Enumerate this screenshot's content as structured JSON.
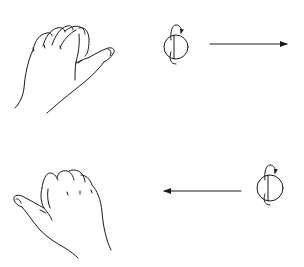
{
  "diagram": {
    "panels": [
      {
        "id": "top",
        "hand": "right-hand-thumb-pointing-right",
        "sphere": {
          "center": [
            176,
            47
          ],
          "radius": 12,
          "rotation_arrow": "curved-around-vertical-axis"
        },
        "arrow": {
          "direction": "right",
          "from": [
            210,
            44
          ],
          "to": [
            287,
            44
          ]
        }
      },
      {
        "id": "bottom",
        "hand": "left-hand-thumb-pointing-left",
        "sphere": {
          "center": [
            270,
            188
          ],
          "radius": 13,
          "rotation_arrow": "curved-around-vertical-axis"
        },
        "arrow": {
          "direction": "left",
          "from": [
            241,
            191
          ],
          "to": [
            164,
            191
          ]
        }
      }
    ],
    "colors": {
      "ink": "#1a1a1a",
      "background": "#ffffff"
    }
  }
}
